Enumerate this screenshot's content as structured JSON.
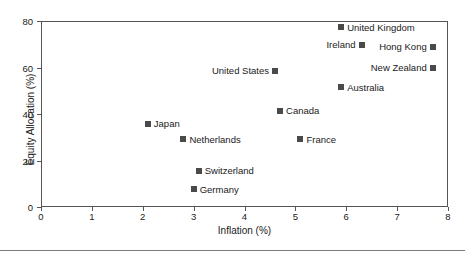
{
  "chart_data": {
    "type": "scatter",
    "title": "",
    "xlabel": "Inflation (%)",
    "ylabel": "Equity Allocation (%)",
    "xlim": [
      0,
      8
    ],
    "ylim": [
      0,
      80
    ],
    "xticks": [
      0,
      1,
      2,
      3,
      4,
      5,
      6,
      7,
      8
    ],
    "yticks": [
      0,
      20,
      40,
      60,
      80
    ],
    "xtick_labels": [
      "0",
      "1",
      "2",
      "3",
      "4",
      "5",
      "6",
      "7",
      "8"
    ],
    "ytick_labels": [
      "0",
      "20",
      "40",
      "60",
      "80"
    ],
    "grid": false,
    "legend": false,
    "marker_color": "#4a4a4a",
    "marker_shape": "square",
    "points": [
      {
        "label": "United Kingdom",
        "x": 5.9,
        "y": 77.4,
        "label_side": "right"
      },
      {
        "label": "Ireland",
        "x": 6.3,
        "y": 69.7,
        "label_side": "left"
      },
      {
        "label": "Hong Kong",
        "x": 7.7,
        "y": 69.0,
        "label_side": "left"
      },
      {
        "label": "New Zealand",
        "x": 7.7,
        "y": 59.8,
        "label_side": "left"
      },
      {
        "label": "United States",
        "x": 4.6,
        "y": 58.5,
        "label_side": "left"
      },
      {
        "label": "Australia",
        "x": 5.9,
        "y": 51.6,
        "label_side": "right"
      },
      {
        "label": "Canada",
        "x": 4.7,
        "y": 41.3,
        "label_side": "right"
      },
      {
        "label": "Japan",
        "x": 2.1,
        "y": 35.7,
        "label_side": "right"
      },
      {
        "label": "Netherlands",
        "x": 2.8,
        "y": 29.2,
        "label_side": "right"
      },
      {
        "label": "France",
        "x": 5.1,
        "y": 29.2,
        "label_side": "right"
      },
      {
        "label": "Switzerland",
        "x": 3.1,
        "y": 15.5,
        "label_side": "right"
      },
      {
        "label": "Germany",
        "x": 3.0,
        "y": 7.7,
        "label_side": "right"
      }
    ]
  }
}
